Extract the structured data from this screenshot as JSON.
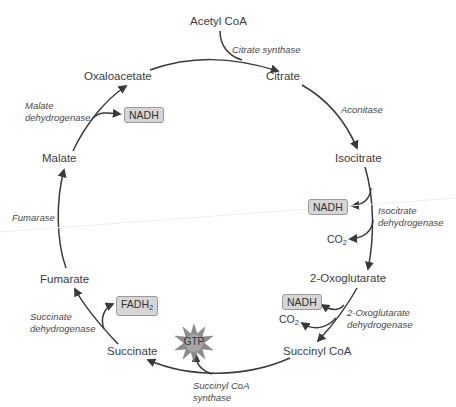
{
  "diagram": {
    "metabolites": {
      "acetyl_coa": "Acetyl CoA",
      "citrate": "Citrate",
      "isocitrate": "Isocitrate",
      "oxoglutarate": "2-Oxoglutarate",
      "succinyl_coa": "Succinyl CoA",
      "succinate": "Succinate",
      "fumarate": "Fumarate",
      "malate": "Malate",
      "oxaloacetate": "Oxaloacetate"
    },
    "enzymes": {
      "citrate_synthase": "Citrate synthase",
      "aconitase": "Aconitase",
      "isocitrate_dh_1": "Isocitrate",
      "isocitrate_dh_2": "dehydrogenase",
      "oxoglutarate_dh_1": "2-Oxoglutarate",
      "oxoglutarate_dh_2": "dehydrogenase",
      "succinyl_coa_synthase_1": "Succinyl CoA",
      "succinyl_coa_synthase_2": "synthase",
      "succinate_dh_1": "Succinate",
      "succinate_dh_2": "dehydrogenase",
      "fumarase": "Fumarase",
      "malate_dh_1": "Malate",
      "malate_dh_2": "dehydrogenase"
    },
    "products": {
      "nadh_malate": "NADH",
      "nadh_isocitrate": "NADH",
      "co2_isocitrate": "CO",
      "co2_isocitrate_sub": "2",
      "nadh_oxoglutarate": "NADH",
      "co2_oxoglutarate": "CO",
      "co2_oxoglutarate_sub": "2",
      "gtp": "GTP",
      "fadh": "FADH",
      "fadh_sub": "2"
    },
    "colors": {
      "arrow": "#3a3a3a",
      "box_fill": "#d6d6d6",
      "box_border": "#9a9a9a",
      "star_fill": "#8c8c8c"
    }
  }
}
